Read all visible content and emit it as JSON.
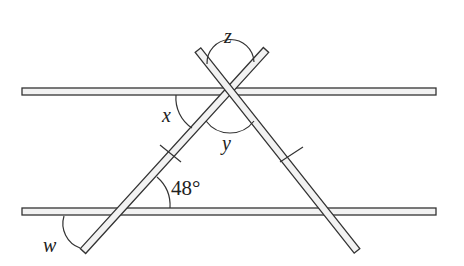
{
  "diagram": {
    "type": "geometry",
    "colors": {
      "stroke": "#333333",
      "bar_fill": "#f2f2f2",
      "background": "#ffffff"
    },
    "parallel_bars": [
      {
        "id": "top-bar",
        "x1": 22,
        "x2": 436,
        "y": 91.5
      },
      {
        "id": "bottom-bar",
        "x1": 22,
        "x2": 436,
        "y": 211.5
      }
    ],
    "sticks": [
      {
        "id": "left-stick",
        "from": [
          266,
          50
        ],
        "to": [
          83,
          251
        ]
      },
      {
        "id": "right-stick",
        "from": [
          198,
          50
        ],
        "to": [
          357,
          251
        ]
      }
    ],
    "labels": {
      "z": "z",
      "x": "x",
      "y": "y",
      "w": "w",
      "angle_48": "48°"
    },
    "tick_marks": "equal-length marks on the two triangle sides"
  }
}
